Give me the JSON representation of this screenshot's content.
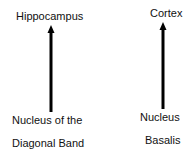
{
  "diagram": {
    "left": {
      "target_label": "Hippocampus",
      "source_label_line1": "Nucleus of the",
      "source_label_line2": "Diagonal Band"
    },
    "right": {
      "target_label": "Cortex",
      "source_label_line1": "Nucleus",
      "source_label_line2": "Basalis"
    },
    "colors": {
      "arrow": "#000000",
      "text": "#111111",
      "background": "#ffffff"
    }
  }
}
